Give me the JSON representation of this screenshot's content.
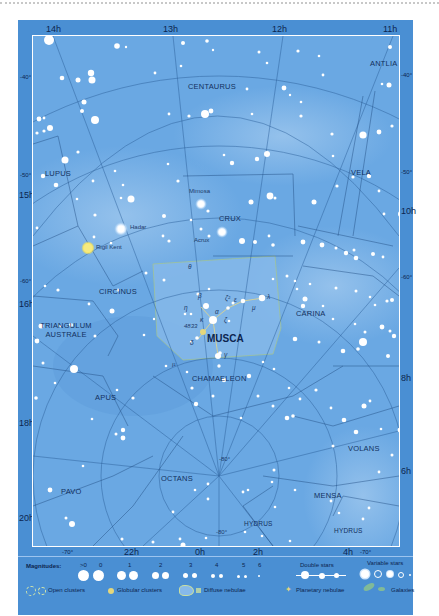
{
  "chart": {
    "ra_labels_top": [
      "14h",
      "13h",
      "12h",
      "11h"
    ],
    "ra_labels_right": [
      "10h",
      "8h",
      "6h"
    ],
    "ra_labels_left": [
      "15h",
      "16h",
      "18h",
      "20h"
    ],
    "ra_labels_bottom": [
      "22h",
      "0h",
      "2h",
      "4h"
    ],
    "dec_labels": {
      "left_top": "-40°",
      "left_50": "-50°",
      "left_60": "-60°",
      "right_top": "-40°",
      "right_50": "-50°",
      "right_60": "-60°",
      "bottom_left": "-70°",
      "bottom_right": "-70°",
      "center_80": "-80°",
      "bottom_80": "-80°"
    },
    "constellations": [
      {
        "name": "CENTAURUS"
      },
      {
        "name": "ANTLIA"
      },
      {
        "name": "LUPUS"
      },
      {
        "name": "VELA"
      },
      {
        "name": "CRUX"
      },
      {
        "name": "CIRCINUS"
      },
      {
        "name": "CARINA"
      },
      {
        "name": "MUSCA",
        "highlighted": true
      },
      {
        "name": "TRIANGULUM AUSTRALE"
      },
      {
        "name": "CHAMAELEON"
      },
      {
        "name": "APUS"
      },
      {
        "name": "VOLANS"
      },
      {
        "name": "OCTANS"
      },
      {
        "name": "PAVO"
      },
      {
        "name": "MENSA"
      },
      {
        "name": "HYDRUS"
      },
      {
        "name": "HYDRUS"
      }
    ],
    "named_stars": [
      {
        "name": "Mimosa"
      },
      {
        "name": "Hadar"
      },
      {
        "name": "Acrux"
      },
      {
        "name": "Rigil Kent"
      }
    ],
    "musca_labels": {
      "theta": "θ",
      "beta": "β",
      "eta": "η",
      "alpha": "α",
      "kappa": "κ",
      "zeta": "ζ",
      "zeta2": "ζ²",
      "epsilon": "ε",
      "lambda": "λ",
      "mu": "μ",
      "delta": "δ",
      "gamma": "γ",
      "iota": "ι¹",
      "ngc": "4833"
    },
    "colors": {
      "frame": "#4a8fd3",
      "sky": "#6aa8e3",
      "musca_highlight": "#8fbde8",
      "grid_lines": "#2c5f9a",
      "stars": "#ffffff",
      "rigil_kent": "#f7e97a",
      "hadar_glow": "#e8f4ff"
    }
  },
  "legend": {
    "magnitudes_label": "Magnitudes:",
    "magnitudes": [
      ">0",
      "0",
      "1",
      "2",
      "3",
      "4",
      "5",
      "6"
    ],
    "double_stars": "Double stars",
    "variable_stars": "Variable stars",
    "open_clusters": "Open clusters",
    "globular_clusters": "Globular clusters",
    "diffuse_nebulae": "Diffuse nebulae",
    "planetary_nebulae": "Planetary nebulae",
    "galaxies": "Galaxies"
  }
}
